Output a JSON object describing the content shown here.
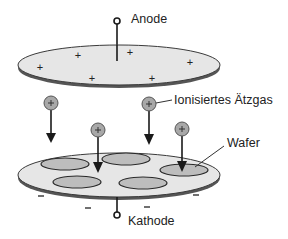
{
  "diagram": {
    "type": "plasma-etching-schematic",
    "labels": {
      "anode": "Anode",
      "cathode": "Kathode",
      "ionized_gas": "Ionisiertes Ätzgas",
      "wafer": "Wafer"
    },
    "anode_disc": {
      "charge_symbol": "+",
      "charges": 6
    },
    "cathode_disc": {
      "charge_symbol": "−",
      "charges": 5,
      "wafers": 5
    },
    "ions": {
      "symbol": "+",
      "count": 4
    },
    "colors": {
      "disc_fill": "#e6e6e6",
      "disc_edge": "#3a3a3a",
      "wafer_fill": "#bdbdbd",
      "ion_fill": "#a8a8a8",
      "line": "#1a1a1a"
    }
  }
}
